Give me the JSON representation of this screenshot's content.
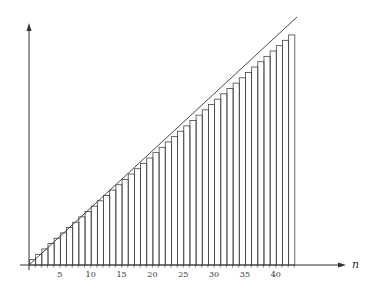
{
  "chart_data": {
    "type": "bar",
    "title": "",
    "xlabel": "n",
    "ylabel": "",
    "x_ticks": [
      5,
      10,
      15,
      20,
      25,
      30,
      35,
      40
    ],
    "categories": [
      1,
      2,
      3,
      4,
      5,
      6,
      7,
      8,
      9,
      10,
      11,
      12,
      13,
      14,
      15,
      16,
      17,
      18,
      19,
      20,
      21,
      22,
      23,
      24,
      25,
      26,
      27,
      28,
      29,
      30,
      31,
      32,
      33,
      34,
      35,
      36,
      37,
      38,
      39,
      40,
      41,
      42,
      43
    ],
    "values_description": "Step bars of increasing height, each slightly below a straight diagonal line",
    "series": [
      {
        "name": "bars",
        "type": "bar",
        "values": [
          1,
          2,
          3,
          4,
          5,
          6,
          7,
          8,
          9,
          10,
          11,
          12,
          13,
          14,
          15,
          16,
          17,
          18,
          19,
          20,
          21,
          22,
          23,
          24,
          25,
          26,
          27,
          28,
          29,
          30,
          31,
          32,
          33,
          34,
          35,
          36,
          37,
          38,
          39,
          40,
          41,
          42,
          43
        ]
      },
      {
        "name": "line",
        "type": "line",
        "x": [
          0,
          43.5
        ],
        "y": [
          0,
          46.5
        ]
      }
    ],
    "grid": false,
    "legend": null
  },
  "axis": {
    "x_label": "n",
    "ticks": [
      "5",
      "10",
      "15",
      "20",
      "25",
      "30",
      "35",
      "40"
    ]
  }
}
